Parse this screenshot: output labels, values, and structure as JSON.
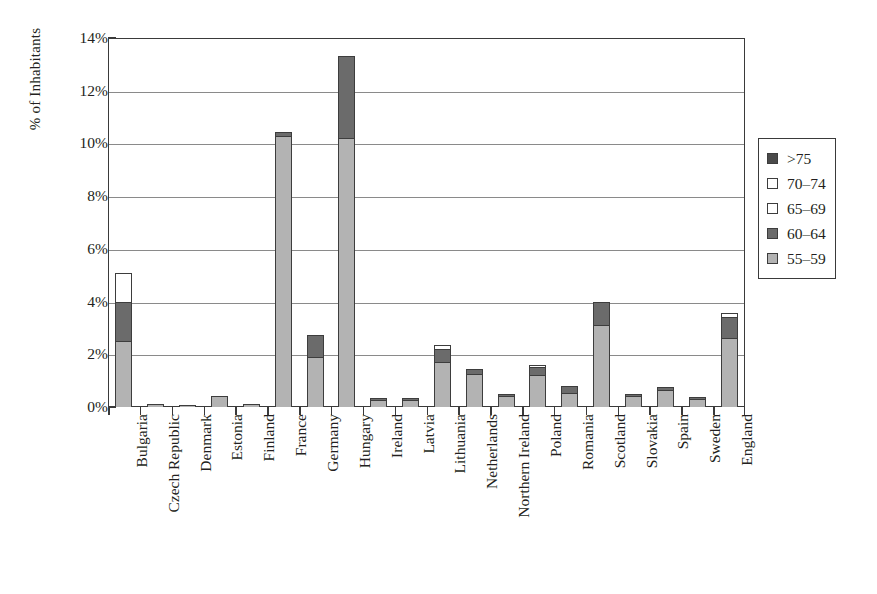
{
  "chart_data": {
    "type": "bar",
    "subtype": "stacked-bar",
    "title": "",
    "xlabel": "",
    "ylabel": "% of Inhabitants",
    "ylim": [
      0,
      14
    ],
    "ytick_labels": [
      "0%",
      "2%",
      "4%",
      "6%",
      "8%",
      "10%",
      "12%",
      "14%"
    ],
    "ytick_values": [
      0,
      2,
      4,
      6,
      8,
      10,
      12,
      14
    ],
    "grid": "horizontal",
    "legend_position": "right",
    "categories": [
      "Bulgaria",
      "Czech Republic",
      "Denmark",
      "Estonia",
      "Finland",
      "France",
      "Germany",
      "Hungary",
      "Ireland",
      "Latvia",
      "Lithuania",
      "Netherlands",
      "Northern Ireland",
      "Poland",
      "Romania",
      "Scotland",
      "Slovakia",
      "Spain",
      "Sweden",
      "England"
    ],
    "series": [
      {
        "name": "55-59",
        "color": "#b3b3b3",
        "values": [
          2.5,
          0.1,
          0.05,
          0.4,
          0.1,
          10.3,
          1.9,
          10.2,
          0.25,
          0.25,
          1.7,
          1.25,
          0.4,
          1.2,
          0.55,
          3.1,
          0.4,
          0.65,
          0.3,
          2.6
        ]
      },
      {
        "name": "60-64",
        "color": "#6b6b6b",
        "values": [
          1.5,
          0.0,
          0.0,
          0.0,
          0.0,
          0.15,
          0.85,
          3.1,
          0.03,
          0.05,
          0.5,
          0.2,
          0.05,
          0.3,
          0.25,
          0.9,
          0.05,
          0.1,
          0.05,
          0.8
        ]
      },
      {
        "name": "65-69",
        "color": "#ffffff",
        "values": [
          1.1,
          0.0,
          0.0,
          0.0,
          0.0,
          0.0,
          0.0,
          0.0,
          0.0,
          0.0,
          0.15,
          0.0,
          0.0,
          0.05,
          0.0,
          0.0,
          0.0,
          0.0,
          0.0,
          0.15
        ]
      },
      {
        "name": "70-74",
        "color": "#ffffff",
        "values": [
          0.0,
          0.0,
          0.0,
          0.0,
          0.0,
          0.0,
          0.0,
          0.0,
          0.0,
          0.0,
          0.0,
          0.0,
          0.0,
          0.0,
          0.0,
          0.0,
          0.0,
          0.0,
          0.0,
          0.0
        ]
      },
      {
        "name": ">75",
        "color": "#4a4a4a",
        "values": [
          0.0,
          0.0,
          0.0,
          0.0,
          0.0,
          0.0,
          0.0,
          0.0,
          0.0,
          0.0,
          0.0,
          0.0,
          0.0,
          0.0,
          0.0,
          0.0,
          0.0,
          0.0,
          0.0,
          0.0
        ]
      }
    ],
    "totals": [
      5.1,
      0.1,
      0.05,
      0.4,
      0.1,
      10.45,
      2.75,
      13.3,
      0.28,
      0.3,
      2.35,
      1.45,
      0.45,
      1.55,
      0.8,
      4.0,
      0.45,
      0.75,
      0.35,
      3.55
    ]
  },
  "legend": {
    "items": [
      {
        "label": ">75",
        "color": "#4a4a4a"
      },
      {
        "label": "70–74",
        "color": "#ffffff"
      },
      {
        "label": "65–69",
        "color": "#ffffff"
      },
      {
        "label": "60–64",
        "color": "#6b6b6b"
      },
      {
        "label": "55–59",
        "color": "#b3b3b3"
      }
    ]
  },
  "colors": {
    "axis": "#3a3a3a",
    "gridline": "#8a8a8a",
    "bar_outline": "#3d3d3d",
    "text": "#231f20",
    "background": "#ffffff"
  }
}
